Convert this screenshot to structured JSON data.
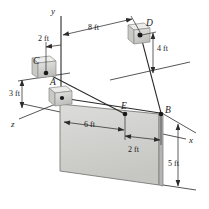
{
  "figure": {
    "type": "engineering-statics-3d-diagram",
    "background_color": "#ffffff",
    "line_color": "#2b2b2b",
    "plate_fill_color": "#d2d2d0",
    "plate_edge_color": "#6f6f6f",
    "block_fill_color": "#d8d8d6",
    "block_shade_color": "#a9a9a7"
  },
  "axes": [
    {
      "id": "y-axis",
      "label": "y",
      "direction": "up",
      "x": 52,
      "y": 11
    },
    {
      "id": "z-axis",
      "label": "z",
      "direction": "lower-left",
      "x": 13,
      "y": 124
    },
    {
      "id": "x-axis",
      "label": "x",
      "direction": "lower-right",
      "x": 191,
      "y": 140
    }
  ],
  "points": [
    {
      "id": "point-A",
      "label": "A",
      "x": 51,
      "y": 82,
      "kind": "support-block"
    },
    {
      "id": "point-B",
      "label": "B",
      "x": 160,
      "y": 112,
      "kind": "corner-node"
    },
    {
      "id": "point-C",
      "label": "C",
      "x": 34,
      "y": 62,
      "kind": "anchor-block"
    },
    {
      "id": "point-D",
      "label": "D",
      "x": 143,
      "y": 24,
      "kind": "anchor-block"
    },
    {
      "id": "point-E",
      "label": "E",
      "x": 125,
      "y": 110,
      "kind": "cable-attachment"
    }
  ],
  "dimensions": [
    {
      "id": "dim-2ft-top",
      "label": "2 ft",
      "x": 34,
      "y": 35,
      "orientation": "horizontal",
      "measures": "C offset from y-axis"
    },
    {
      "id": "dim-8ft-top",
      "label": "8 ft",
      "x": 85,
      "y": 30,
      "orientation": "horizontal",
      "measures": "y-axis to D"
    },
    {
      "id": "dim-4ft-right",
      "label": "4 ft",
      "x": 157,
      "y": 44,
      "orientation": "vertical",
      "measures": "D height above plane"
    },
    {
      "id": "dim-3ft-left",
      "label": "3 ft",
      "x": 11,
      "y": 96,
      "orientation": "vertical",
      "measures": "C height above A plane"
    },
    {
      "id": "dim-6ft-plate",
      "label": "6 ft",
      "x": 88,
      "y": 128,
      "orientation": "horizontal",
      "measures": "A to E along plate top"
    },
    {
      "id": "dim-2ft-plate",
      "label": "2 ft",
      "x": 133,
      "y": 150,
      "orientation": "horizontal",
      "measures": "E to B along plate top"
    },
    {
      "id": "dim-5ft-right",
      "label": "5 ft",
      "x": 172,
      "y": 166,
      "orientation": "vertical",
      "measures": "plate height at B"
    }
  ],
  "members": [
    {
      "id": "cable-C-to-E",
      "from": "C",
      "to": "E",
      "style": "solid"
    },
    {
      "id": "cable-D-to-B",
      "from": "D",
      "to": "B",
      "style": "solid"
    },
    {
      "id": "cable-A-to-B",
      "from": "A",
      "to": "B",
      "style": "solid"
    }
  ],
  "plate": {
    "id": "rectangular-plate",
    "corners_label": "A-E-B plate",
    "fill": "#d2d2d0"
  }
}
